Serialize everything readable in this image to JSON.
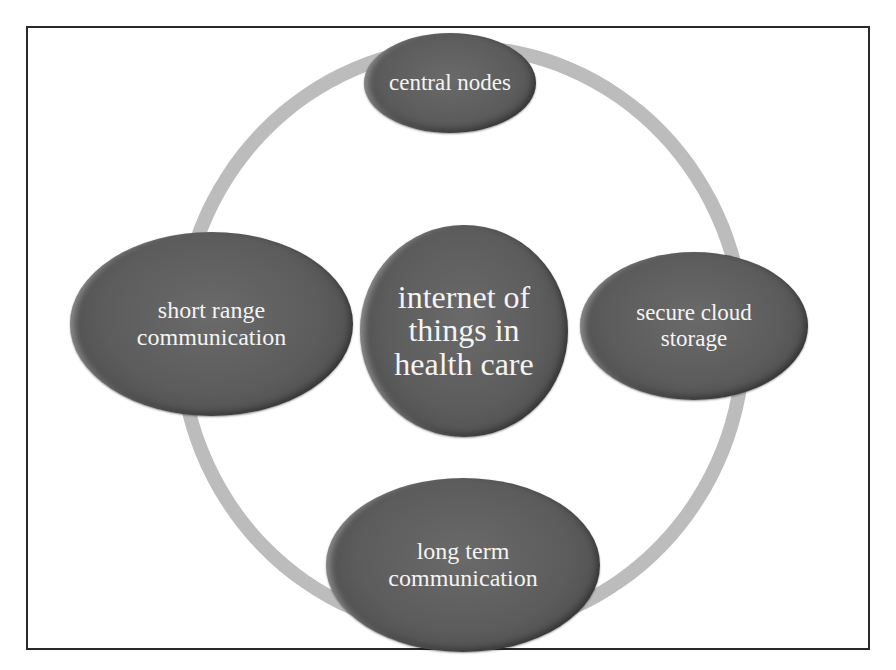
{
  "diagram": {
    "type": "cycle-with-hub",
    "center": {
      "label": "internet of\nthings in\nhealth care"
    },
    "nodes": [
      {
        "position": "top",
        "label": "central nodes"
      },
      {
        "position": "right",
        "label": "secure cloud\nstorage"
      },
      {
        "position": "bottom",
        "label": "long term\ncommunication"
      },
      {
        "position": "left",
        "label": "short range\ncommunication"
      }
    ],
    "colors": {
      "node_fill": "#5c5c5c",
      "node_text": "#f4f4f4",
      "ring": "#bcbcbc",
      "frame_border": "#2a2a2a",
      "background": "#ffffff"
    }
  }
}
